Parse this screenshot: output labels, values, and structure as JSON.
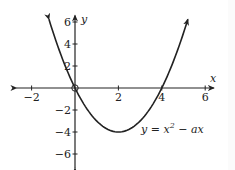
{
  "chart_data": {
    "type": "line",
    "title": "",
    "equation_label": "y = x^2 - ax",
    "xlabel": "x",
    "ylabel": "y",
    "x_ticks": [
      -2,
      2,
      4,
      6
    ],
    "y_ticks": [
      6,
      4,
      2,
      -2,
      -4,
      -6
    ],
    "x_tick_labels": [
      "−2",
      "2",
      "4",
      "6"
    ],
    "y_tick_labels": [
      "6",
      "4",
      "2",
      "−2",
      "−4",
      "−6"
    ],
    "xlim": [
      -2.7,
      6.4
    ],
    "ylim": [
      -7.3,
      6.6
    ],
    "grid": false,
    "series": [
      {
        "name": "y = x^2 - 4x",
        "x": [
          -1.2,
          -1,
          0,
          1,
          2,
          3,
          4,
          5,
          5.2
        ],
        "y": [
          6.24,
          5,
          0,
          -3,
          -4,
          -3,
          0,
          5,
          6.24
        ]
      }
    ],
    "annotations": [
      {
        "type": "open-circle",
        "x": 0,
        "y": 0
      }
    ]
  }
}
